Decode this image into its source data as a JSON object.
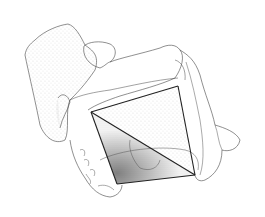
{
  "figure": {
    "subject": "Anatomical pen-and-ink illustration of a pelvis with geometric triangles overlaid",
    "background": "#ffffff",
    "line_color": "#333333",
    "stipple_color": "#555555",
    "triangle": {
      "vertices": [
        [
          91,
          112
        ],
        [
          178,
          86
        ],
        [
          195,
          175
        ],
        [
          117,
          184
        ]
      ],
      "diagonal": [
        [
          91,
          112
        ],
        [
          195,
          175
        ]
      ]
    }
  }
}
